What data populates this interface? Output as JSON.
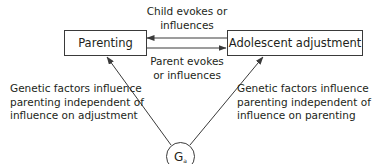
{
  "diagram": {
    "nodes": {
      "parenting": {
        "label": "Parenting"
      },
      "adjustment": {
        "label": "Adolescent adjustment"
      },
      "genes": {
        "symbol": "G",
        "subscript": "a"
      }
    },
    "edges": {
      "child_to_parent": {
        "label_line1": "Child evokes or",
        "label_line2": "influences"
      },
      "parent_to_child": {
        "label_line1": "Parent evokes",
        "label_line2": "or influences"
      },
      "genes_to_parenting": {
        "label_line1": "Genetic factors influence",
        "label_line2": "parenting independent of",
        "label_line3": "influence on adjustment"
      },
      "genes_to_adjustment": {
        "label_line1": "Genetic factors influence",
        "label_line2": "parenting independent of",
        "label_line3": "influence on parenting"
      }
    },
    "colors": {
      "stroke": "#3a3a3a",
      "text": "#231f20",
      "background": "#ffffff"
    }
  }
}
